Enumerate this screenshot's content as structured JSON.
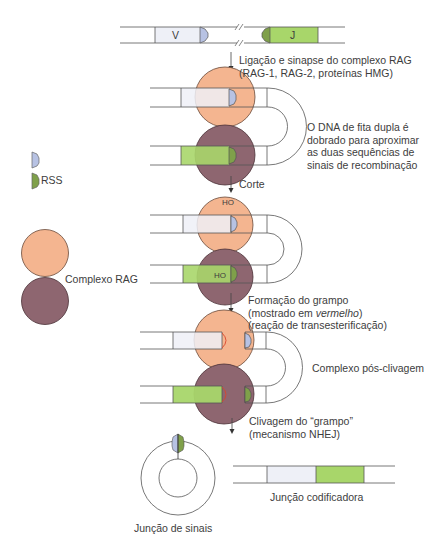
{
  "colors": {
    "line": "#555555",
    "v_segment": "#eef0f7",
    "j_segment": "#a8d66a",
    "rss_blue": "#b7c2e3",
    "rss_green": "#7fa04a",
    "rag_orange": "#f4b590",
    "rag_purple": "#8e6670",
    "hairpin_red": "#d9452b"
  },
  "top_dna": {
    "v_label": "V",
    "j_label": "J"
  },
  "steps": [
    {
      "line1": "Ligação e sinapse do complexo RAG",
      "line2": "(RAG-1, RAG-2, proteínas HMG)"
    },
    {
      "line1": "Corte"
    },
    {
      "line1": "Formação do grampo",
      "line2_pre": "(mostrado em ",
      "line2_em": "vermelho",
      "line2_post": ")",
      "line3": "(reação de transesterificação)"
    },
    {
      "line1": "Clivagem do “grampo”",
      "line2": "(mecanismo NHEJ)"
    }
  ],
  "annotations": {
    "folding_note": [
      "O DNA de fita dupla é",
      "dobrado para aproximar",
      "as duas sequências de",
      "sinais de recombinação"
    ],
    "post_cleavage": "Complexo pós-clivagem",
    "ho_top": "HO",
    "ho_bottom": "HO"
  },
  "legend": {
    "rss_label": "RSS",
    "rag_label": "Complexo RAG"
  },
  "products": {
    "signal_joint": "Junção de sinais",
    "coding_joint": "Junção codificadora"
  }
}
